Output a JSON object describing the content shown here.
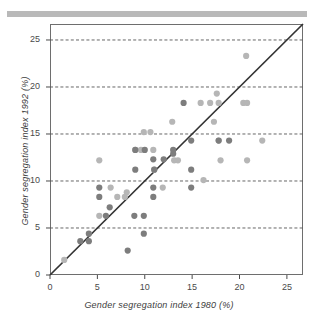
{
  "figure": {
    "banner": "page-scan-bar"
  },
  "chart_data": {
    "type": "scatter",
    "title": "",
    "xlabel": "Gender segregation index 1980 (%)",
    "ylabel": "Gender segregation index 1992 (%)",
    "xlim": [
      0,
      26.7
    ],
    "ylim": [
      0,
      26.7
    ],
    "xticks": [
      0,
      5,
      10,
      15,
      20,
      25
    ],
    "yticks": [
      0,
      5,
      10,
      15,
      20,
      25
    ],
    "xticklabels": [
      "0",
      "5",
      "10",
      "15",
      "20",
      "25"
    ],
    "yticklabels": [
      "0",
      "5",
      "10",
      "15",
      "20",
      "25"
    ],
    "grid": "horizontal-dashed",
    "legend": "none",
    "reference_line": {
      "name": "y = x diagonal",
      "from": [
        0,
        0
      ],
      "to": [
        26.7,
        26.7
      ],
      "color": "#333333"
    },
    "marker_colors": {
      "dark": "#7d7d7d",
      "light": "#b6b6b6"
    },
    "series": [
      {
        "name": "dark-markers",
        "color": "#7d7d7d",
        "points": [
          [
            3.2,
            3.6
          ],
          [
            4.1,
            3.6
          ],
          [
            4.1,
            4.4
          ],
          [
            5.2,
            9.3
          ],
          [
            5.2,
            8.3
          ],
          [
            5.9,
            6.3
          ],
          [
            6.3,
            7.2
          ],
          [
            8.2,
            2.6
          ],
          [
            8.9,
            6.3
          ],
          [
            9.0,
            13.3
          ],
          [
            9.0,
            11.2
          ],
          [
            9.9,
            6.3
          ],
          [
            9.9,
            4.4
          ],
          [
            10.0,
            13.3
          ],
          [
            10.9,
            12.3
          ],
          [
            10.9,
            9.3
          ],
          [
            10.9,
            8.3
          ],
          [
            11.0,
            11.2
          ],
          [
            12.0,
            12.3
          ],
          [
            13.0,
            12.9
          ],
          [
            14.1,
            18.3
          ],
          [
            14.9,
            14.3
          ],
          [
            14.9,
            11.2
          ],
          [
            14.9,
            9.3
          ],
          [
            17.8,
            14.3
          ],
          [
            18.9,
            14.3
          ],
          [
            13.0,
            13.3
          ]
        ]
      },
      {
        "name": "light-markers",
        "color": "#b6b6b6",
        "points": [
          [
            1.5,
            1.6
          ],
          [
            5.2,
            12.2
          ],
          [
            5.2,
            6.3
          ],
          [
            6.4,
            9.3
          ],
          [
            7.1,
            8.3
          ],
          [
            7.9,
            8.3
          ],
          [
            8.1,
            8.8
          ],
          [
            9.0,
            13.3
          ],
          [
            9.6,
            13.3
          ],
          [
            9.9,
            15.2
          ],
          [
            10.6,
            15.2
          ],
          [
            10.9,
            13.3
          ],
          [
            11.0,
            11.2
          ],
          [
            11.9,
            9.3
          ],
          [
            12.9,
            16.3
          ],
          [
            13.1,
            12.2
          ],
          [
            13.5,
            12.2
          ],
          [
            15.9,
            18.3
          ],
          [
            16.2,
            10.1
          ],
          [
            16.9,
            18.3
          ],
          [
            17.3,
            16.3
          ],
          [
            17.6,
            19.3
          ],
          [
            17.8,
            18.3
          ],
          [
            17.8,
            14.3
          ],
          [
            18.0,
            12.2
          ],
          [
            20.4,
            18.3
          ],
          [
            20.7,
            23.3
          ],
          [
            20.8,
            18.3
          ],
          [
            20.8,
            12.2
          ],
          [
            22.4,
            14.3
          ]
        ]
      }
    ]
  }
}
